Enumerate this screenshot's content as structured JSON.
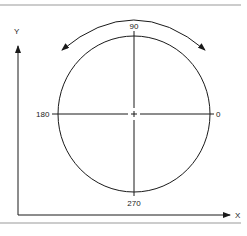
{
  "diagram": {
    "type": "polar-angle-reference",
    "axes": {
      "y_label": "Y",
      "x_label": "X"
    },
    "angle_labels": {
      "top": "90",
      "left": "180",
      "right": "0",
      "bottom": "270"
    },
    "rotation_arrow": "bidirectional-arc",
    "colors": {
      "line": "#1a1a1a",
      "rule": "#888888",
      "background": "#ffffff"
    }
  }
}
